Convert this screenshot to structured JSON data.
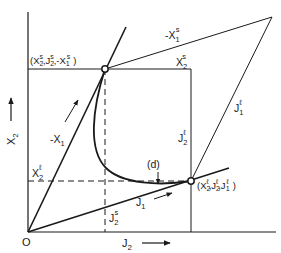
{
  "diagram": {
    "type": "phase-diagram",
    "colors": {
      "ink": "#1a1a1a",
      "background": "#ffffff"
    },
    "axes": {
      "x_label": {
        "main": "J",
        "sub": "2"
      },
      "y_label": {
        "main": "X",
        "sub": "2"
      },
      "origin_label": "O"
    },
    "points": {
      "s_point": {
        "label": "(X2s, J2s, -X1s)",
        "parts": [
          "(X",
          "2",
          "s",
          ",J",
          "2",
          "s",
          ",-X",
          "1",
          "s",
          ")"
        ]
      },
      "l_point": {
        "label": "(X2l, J2l, J1l)",
        "parts": [
          "(X",
          "2",
          "ℓ",
          ",J",
          "2",
          "ℓ",
          ",J",
          "1",
          "ℓ",
          ")"
        ]
      }
    },
    "labels": {
      "neg_x1_s": {
        "main": "-X",
        "sub": "1",
        "sup": "s"
      },
      "x2_s": {
        "main": "X",
        "sub": "2",
        "sup": "s"
      },
      "j1_l": {
        "main": "J",
        "sub": "1",
        "sup": "ℓ"
      },
      "j2_l": {
        "main": "J",
        "sub": "2",
        "sup": "ℓ"
      },
      "neg_x1": {
        "main": "-X",
        "sub": "1"
      },
      "x2_l": {
        "main": "X",
        "sub": "2",
        "sup": "ℓ"
      },
      "j2_s": {
        "main": "J",
        "sub": "2",
        "sup": "s"
      },
      "j1": {
        "main": "J",
        "sub": "1"
      },
      "d_marker": "(d)"
    }
  }
}
